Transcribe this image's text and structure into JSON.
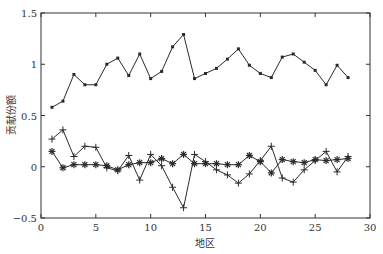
{
  "chart_data": {
    "type": "line",
    "title": "",
    "xlabel": "地区",
    "ylabel": "贡献份额",
    "xlim": [
      0,
      30
    ],
    "ylim": [
      -0.5,
      1.5
    ],
    "xticks": [
      0,
      5,
      10,
      15,
      20,
      25,
      30
    ],
    "yticks": [
      -0.5,
      0,
      0.5,
      1,
      1.5
    ],
    "ytick_labels": [
      "−0.5",
      "0",
      "0.5",
      "1",
      "1.5"
    ],
    "grid": false,
    "legend": null,
    "x": [
      1,
      2,
      3,
      4,
      5,
      6,
      7,
      8,
      9,
      10,
      11,
      12,
      13,
      14,
      15,
      16,
      17,
      18,
      19,
      20,
      21,
      22,
      23,
      24,
      25,
      26,
      27,
      28
    ],
    "series": [
      {
        "name": "series-1",
        "marker": "dot",
        "values": [
          0.58,
          0.64,
          0.9,
          0.8,
          0.8,
          1.0,
          1.06,
          0.89,
          1.1,
          0.86,
          0.93,
          1.17,
          1.29,
          0.86,
          0.91,
          0.96,
          1.05,
          1.15,
          0.99,
          0.91,
          0.87,
          1.07,
          1.1,
          1.02,
          0.94,
          0.8,
          0.99,
          0.87
        ]
      },
      {
        "name": "series-2",
        "marker": "plus",
        "values": [
          0.27,
          0.36,
          0.1,
          0.2,
          0.19,
          -0.01,
          -0.04,
          0.11,
          -0.13,
          0.12,
          0.01,
          -0.2,
          -0.4,
          0.12,
          0.05,
          -0.03,
          -0.08,
          -0.16,
          -0.07,
          0.06,
          0.2,
          -0.11,
          -0.15,
          -0.03,
          0.06,
          0.15,
          -0.05,
          0.1
        ]
      },
      {
        "name": "series-3",
        "marker": "star",
        "values": [
          0.15,
          -0.01,
          0.02,
          0.02,
          0.02,
          0.01,
          -0.03,
          0.02,
          0.04,
          0.04,
          0.08,
          0.03,
          0.12,
          0.03,
          0.03,
          0.03,
          0.02,
          0.02,
          0.11,
          0.05,
          -0.06,
          0.07,
          0.05,
          0.04,
          0.07,
          0.06,
          0.07,
          0.08
        ]
      }
    ]
  },
  "style": {
    "line_color": "#2b2b2b",
    "axis_color": "#333333"
  }
}
